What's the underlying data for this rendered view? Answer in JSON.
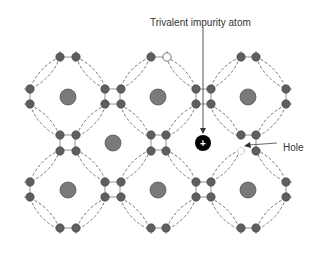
{
  "diagram": {
    "labels": {
      "impurity": "Trivalent impurity atom",
      "hole": "Hole",
      "impurity_symbol": "+"
    },
    "colors": {
      "atom": "#5f5f5f",
      "nucleus": "#7a7a7a",
      "impurity": "#000000",
      "bond": "#666666"
    },
    "nuclei": [
      {
        "x": 68,
        "y": 97
      },
      {
        "x": 158,
        "y": 97
      },
      {
        "x": 248,
        "y": 97
      },
      {
        "x": 113,
        "y": 143
      },
      {
        "x": 68,
        "y": 190
      },
      {
        "x": 158,
        "y": 190
      },
      {
        "x": 248,
        "y": 190
      }
    ],
    "impurity_atom": {
      "x": 203,
      "y": 143
    }
  }
}
